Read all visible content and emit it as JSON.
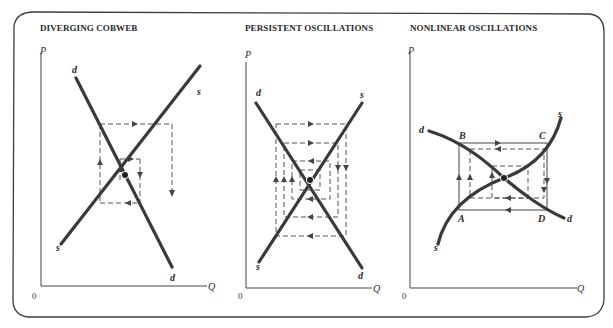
{
  "panels": [
    {
      "title": "DIVERGING COBWEB",
      "axis_y": "P",
      "axis_x": "Q",
      "origin": "0",
      "curve_labels": {
        "d_top": "d",
        "s_top": "s",
        "s_bottom": "s",
        "d_bottom": "d"
      }
    },
    {
      "title": "PERSISTENT OSCILLATIONS",
      "axis_y": "P",
      "axis_x": "Q",
      "origin": "0",
      "curve_labels": {
        "d_top": "d",
        "s_top": "s",
        "s_bottom": "s",
        "d_bottom": "d"
      }
    },
    {
      "title": "NONLINEAR OSCILLATIONS",
      "axis_y": "P",
      "axis_x": "Q",
      "origin": "0",
      "curve_labels": {
        "d_top": "d",
        "s_top": "s",
        "s_bottom": "s",
        "d_bottom": "d"
      },
      "points": {
        "A": "A",
        "B": "B",
        "C": "C",
        "D": "D"
      }
    }
  ],
  "colors": {
    "curve": "#3a3a3a",
    "axis": "#444444",
    "dash": "#555555",
    "frame": "#3c3c3c"
  }
}
